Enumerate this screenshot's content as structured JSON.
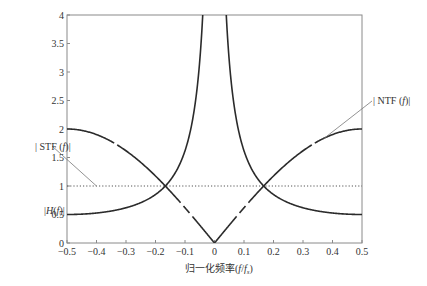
{
  "chart_data": {
    "type": "line",
    "title": "",
    "xlabel": "归一化频率(f/fs)",
    "xlabel_parts": {
      "main": "归一化频率(",
      "f": "f",
      "slash": "/",
      "fs": "f",
      "sub": "s",
      "close": ")"
    },
    "ylabel": "",
    "xlim": [
      -0.5,
      0.5
    ],
    "ylim": [
      0,
      4
    ],
    "grid": false,
    "legend_position": "none",
    "x_ticks": [
      -0.5,
      -0.4,
      -0.3,
      -0.2,
      -0.1,
      0,
      0.1,
      0.2,
      0.3,
      0.4,
      0.5
    ],
    "x_tick_labels": [
      "-0.5",
      "-0.4",
      "-0.3",
      "-0.2",
      "-0.1",
      "0",
      "0.1",
      "0.2",
      "0.3",
      "0.4",
      "0.5"
    ],
    "y_ticks": [
      0,
      0.5,
      1,
      1.5,
      2,
      2.5,
      3,
      3.5,
      4
    ],
    "y_tick_labels": [
      "0",
      "0.5",
      "1",
      "1.5",
      "2",
      "2.5",
      "3",
      "3.5",
      "4"
    ],
    "series": [
      {
        "name": "|NTF(f)|",
        "formula": "2|sin(πf)|",
        "x": [
          -0.5,
          -0.4,
          -0.3,
          -0.2,
          -0.167,
          -0.1,
          0,
          0.1,
          0.167,
          0.2,
          0.3,
          0.4,
          0.5
        ],
        "values": [
          2.0,
          1.9,
          1.62,
          1.18,
          1.0,
          0.62,
          0.0,
          0.62,
          1.0,
          1.18,
          1.62,
          1.9,
          2.0
        ],
        "style": "solid-dashdot",
        "color": "#333333"
      },
      {
        "name": "|H(f)|",
        "formula": "1/(2|sin(πf)|)",
        "x": [
          -0.5,
          -0.4,
          -0.3,
          -0.2,
          -0.167,
          -0.1,
          -0.05,
          0.05,
          0.1,
          0.167,
          0.2,
          0.3,
          0.4,
          0.5
        ],
        "values": [
          0.5,
          0.53,
          0.62,
          0.85,
          1.0,
          1.62,
          3.2,
          3.2,
          1.62,
          1.0,
          0.85,
          0.62,
          0.53,
          0.5
        ],
        "style": "solid",
        "color": "#333333"
      },
      {
        "name": "|STF(f)|",
        "formula": "1",
        "x": [
          -0.5,
          0.5
        ],
        "values": [
          1,
          1
        ],
        "style": "dotted",
        "color": "#555555"
      }
    ],
    "annotations": [
      {
        "text": "|STF(f)|",
        "x_px": 36,
        "y_px": 150,
        "pointer_to": [
          -0.4,
          1.0
        ]
      },
      {
        "text": "|H(f)|",
        "x_px": 44,
        "y_px": 213
      },
      {
        "text": "|NTF(f)|",
        "x_px": 375,
        "y_px": 103,
        "pointer_to": [
          0.37,
          1.83
        ]
      }
    ]
  },
  "labels": {
    "stf": "|STF(f)|",
    "stf_prefix": "| STF (",
    "stf_f": "f",
    "stf_suffix": ")|",
    "h_prefix": "|",
    "h_H": "H",
    "h_mid": "(",
    "h_f": "f",
    "h_suffix": ")|",
    "ntf_prefix": "| NTF (",
    "ntf_f": "f",
    "ntf_suffix": ")|"
  },
  "colors": {
    "axis": "#8a8a8a",
    "curve": "#2b2b2b",
    "leader": "#777777",
    "dotted": "#555555"
  }
}
